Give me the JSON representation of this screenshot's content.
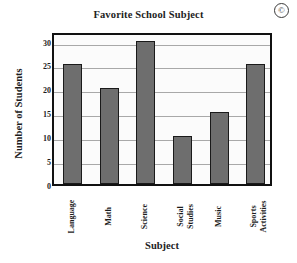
{
  "chart_data": {
    "type": "bar",
    "title": "Favorite School Subject",
    "xlabel": "Subject",
    "ylabel": "Number of Students",
    "categories": [
      "Language",
      "Math",
      "Science",
      "Social Studies",
      "Music",
      "Sports Activities"
    ],
    "values": [
      25,
      20,
      30,
      10,
      15,
      25
    ],
    "ylim": [
      0,
      32
    ],
    "yticks": [
      0,
      5,
      10,
      15,
      20,
      25,
      30
    ],
    "ytick_labels": [
      "0",
      "5",
      "10",
      "15",
      "20",
      "25",
      "30"
    ],
    "grid": true,
    "grid_axis": "y",
    "legend": false,
    "bar_color": "#6e6e6e",
    "bar_edge_color": "#1a1a1a",
    "plot_background": "#fbfbfb",
    "frame_color": "#111111",
    "gridline_color": "#a8a8a8",
    "xtick_rotation": -90
  },
  "marks": {
    "copyright_symbol": "©"
  }
}
